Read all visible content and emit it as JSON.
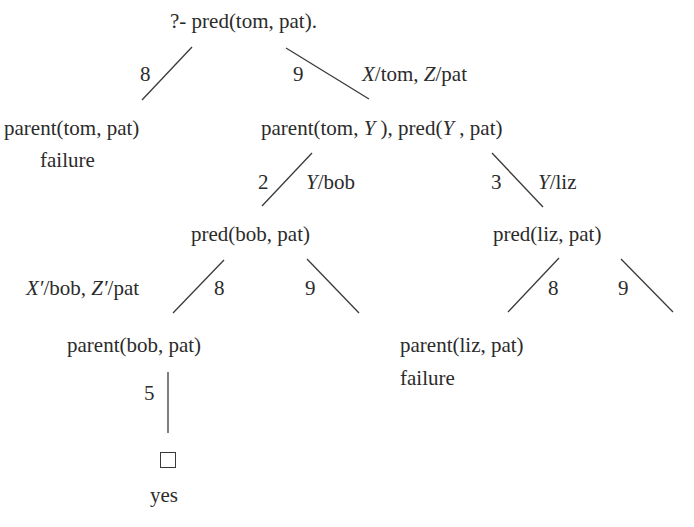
{
  "diagram": {
    "type": "prolog-resolution-tree",
    "nodes": {
      "root": "?- pred(tom, pat).",
      "left1": "parent(tom, pat)",
      "left1_status": "failure",
      "right1_a": "parent(tom, ",
      "right1_Y1": "Y",
      "right1_b": " ), pred(",
      "right1_Y2": "Y",
      "right1_c": " , pat)",
      "bob": "pred(bob, pat)",
      "liz": "pred(liz, pat)",
      "parent_bob": "parent(bob, pat)",
      "parent_liz": "parent(liz, pat)",
      "parent_liz_status": "failure",
      "success_box": "□",
      "success_label": "yes"
    },
    "edges": [
      {
        "from": "root",
        "to": "left1",
        "clause": "8",
        "subst": ""
      },
      {
        "from": "root",
        "to": "right1",
        "clause": "9",
        "subst_var1": "X",
        "subst_val1": "/tom, ",
        "subst_var2": "Z",
        "subst_val2": "/pat"
      },
      {
        "from": "right1",
        "to": "bob",
        "clause": "2",
        "subst_var1": "Y",
        "subst_val1": "/bob"
      },
      {
        "from": "right1",
        "to": "liz",
        "clause": "3",
        "subst_var1": "Y",
        "subst_val1": "/liz"
      },
      {
        "from": "bob",
        "to": "parent_bob",
        "clause": "8",
        "subst_var1": "X′",
        "subst_val1": "/bob, ",
        "subst_var2": "Z′",
        "subst_val2": "/pat"
      },
      {
        "from": "bob",
        "to": "none",
        "clause": "9"
      },
      {
        "from": "liz",
        "to": "parent_liz",
        "clause": "8"
      },
      {
        "from": "liz",
        "to": "none",
        "clause": "9"
      },
      {
        "from": "parent_bob",
        "to": "success",
        "clause": "5"
      }
    ]
  }
}
